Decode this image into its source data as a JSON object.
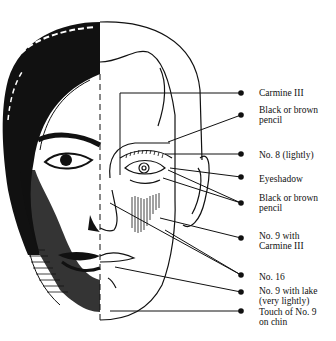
{
  "diagram": {
    "colors": {
      "ink": "#111111",
      "paper": "#ffffff"
    },
    "labels": [
      {
        "id": "carmine",
        "text": "Carmine III",
        "y": 88,
        "dot": [
          241,
          93
        ],
        "target": [
          120,
          93
        ]
      },
      {
        "id": "pencil-top",
        "text": "Black or brown\npencil",
        "y": 105,
        "dot": [
          241,
          115
        ],
        "target": [
          168,
          142
        ]
      },
      {
        "id": "no8",
        "text": "No. 8 (lightly)",
        "y": 150,
        "dot": [
          241,
          154
        ],
        "target": [
          165,
          154
        ]
      },
      {
        "id": "eyeshadow",
        "text": "Eyeshadow",
        "y": 174,
        "dot": [
          241,
          177
        ],
        "target": [
          170,
          168
        ]
      },
      {
        "id": "pencil-bottom",
        "text": "Black or brown\npencil",
        "y": 193,
        "dot": [
          241,
          203
        ],
        "target": [
          163,
          178
        ]
      },
      {
        "id": "no9-carmine",
        "text": "No. 9 with\nCarmine III",
        "y": 231,
        "dot": [
          241,
          238
        ],
        "target": [
          160,
          218
        ]
      },
      {
        "id": "no16",
        "text": "No. 16",
        "y": 272,
        "dot": [
          241,
          275
        ],
        "target": [
          110,
          203
        ]
      },
      {
        "id": "no9-lake",
        "text": "No. 9 with lake\n(very lightly)",
        "y": 286,
        "dot": [
          241,
          292
        ],
        "target": [
          115,
          267
        ]
      },
      {
        "id": "no9-chin",
        "text": "Touch of No. 9\non chin",
        "y": 307,
        "dot": [
          241,
          311
        ],
        "target": [
          110,
          311
        ]
      }
    ]
  }
}
